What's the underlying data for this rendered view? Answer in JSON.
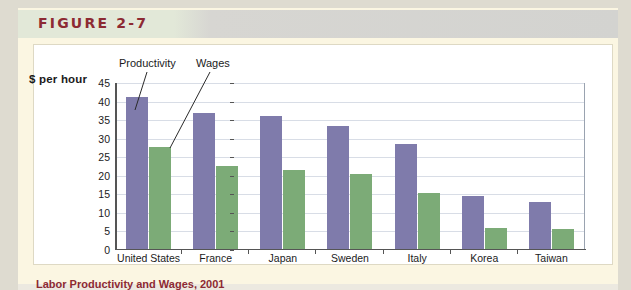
{
  "figure": {
    "label": "FIGURE 2-7",
    "caption": "Labor Productivity and Wages, 2001",
    "header_color": "#8d2a33"
  },
  "chart_data": {
    "type": "bar",
    "title": "",
    "xlabel": "",
    "ylabel": "$ per hour",
    "ylim": [
      0,
      45
    ],
    "ytick_step": 5,
    "grid": true,
    "legend": "annotation-callouts",
    "categories": [
      "United States",
      "France",
      "Japan",
      "Sweden",
      "Italy",
      "Korea",
      "Taiwan"
    ],
    "yticks": [
      "0",
      "5",
      "10",
      "15",
      "20",
      "25",
      "30",
      "35",
      "40",
      "45"
    ],
    "series": [
      {
        "name": "Productivity",
        "color": "#7f7bab",
        "values": [
          41.3,
          36.8,
          36.0,
          33.5,
          28.5,
          14.5,
          13.0
        ]
      },
      {
        "name": "Wages",
        "color": "#7cab77",
        "values": [
          27.7,
          22.7,
          21.5,
          20.5,
          15.3,
          5.9,
          5.6
        ]
      }
    ],
    "annotations": [
      {
        "text": "Productivity",
        "points_to": "United States productivity bar"
      },
      {
        "text": "Wages",
        "points_to": "United States wages bar"
      }
    ]
  }
}
